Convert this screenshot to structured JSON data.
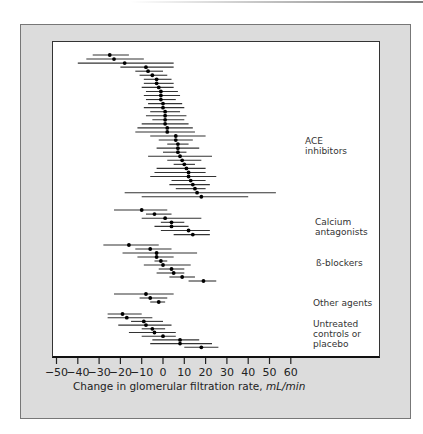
{
  "chart_data": {
    "type": "forest",
    "title": "",
    "xlabel": "Change in glomerular filtration rate,",
    "xlabel_unit": "mL/min",
    "ylabel": "",
    "xlim": [
      -50,
      60
    ],
    "x_ticks": [
      -50,
      -40,
      -30,
      -20,
      -10,
      0,
      10,
      20,
      30,
      40,
      50,
      60
    ],
    "x_tick_labels": [
      "−50",
      "−40",
      "−30",
      "−20",
      "−10",
      "0",
      "10",
      "20",
      "30",
      "40",
      "50",
      "60"
    ],
    "grid": false,
    "groups": [
      {
        "name": "ACE inhibitors",
        "label_lines": [
          "ACE",
          "inhibitors"
        ],
        "studies": [
          {
            "mean": -25,
            "low": -33,
            "high": -16
          },
          {
            "mean": -23,
            "low": -36,
            "high": -9
          },
          {
            "mean": -18,
            "low": -40,
            "high": 5
          },
          {
            "mean": -8,
            "low": -20,
            "high": 5
          },
          {
            "mean": -7,
            "low": -13,
            "high": 0
          },
          {
            "mean": -5,
            "low": -11,
            "high": 2
          },
          {
            "mean": -3,
            "low": -9,
            "high": 4
          },
          {
            "mean": -3,
            "low": -9,
            "high": 5
          },
          {
            "mean": -2,
            "low": -10,
            "high": 5
          },
          {
            "mean": -1,
            "low": -8,
            "high": 7
          },
          {
            "mean": -1,
            "low": -9,
            "high": 8
          },
          {
            "mean": -1,
            "low": -8,
            "high": 6
          },
          {
            "mean": 0,
            "low": -7,
            "high": 9
          },
          {
            "mean": 0,
            "low": -9,
            "high": 10
          },
          {
            "mean": 1,
            "low": -6,
            "high": 8
          },
          {
            "mean": 1,
            "low": -8,
            "high": 11
          },
          {
            "mean": 1,
            "low": -5,
            "high": 10
          },
          {
            "mean": 1,
            "low": -10,
            "high": 12
          },
          {
            "mean": 2,
            "low": -12,
            "high": 14
          },
          {
            "mean": 2,
            "low": -13,
            "high": 15
          },
          {
            "mean": 6,
            "low": -6,
            "high": 20
          },
          {
            "mean": 6,
            "low": -2,
            "high": 14
          },
          {
            "mean": 7,
            "low": 2,
            "high": 12
          },
          {
            "mean": 7,
            "low": -3,
            "high": 17
          },
          {
            "mean": 7,
            "low": 0,
            "high": 11
          },
          {
            "mean": 8,
            "low": -7,
            "high": 23
          },
          {
            "mean": 9,
            "low": 2,
            "high": 18
          },
          {
            "mean": 10,
            "low": 5,
            "high": 15
          },
          {
            "mean": 11,
            "low": -3,
            "high": 20
          },
          {
            "mean": 12,
            "low": -4,
            "high": 20
          },
          {
            "mean": 12,
            "low": -6,
            "high": 25
          },
          {
            "mean": 13,
            "low": 4,
            "high": 20
          },
          {
            "mean": 14,
            "low": 3,
            "high": 22
          },
          {
            "mean": 15,
            "low": 6,
            "high": 20
          },
          {
            "mean": 16,
            "low": -18,
            "high": 53
          },
          {
            "mean": 18,
            "low": -10,
            "high": 40
          }
        ]
      },
      {
        "name": "Calcium antagonists",
        "label_lines": [
          "Calcium",
          "antagonists"
        ],
        "studies": [
          {
            "mean": -10,
            "low": -23,
            "high": 2
          },
          {
            "mean": -4,
            "low": -8,
            "high": 4
          },
          {
            "mean": 1,
            "low": -10,
            "high": 18
          },
          {
            "mean": 4,
            "low": -1,
            "high": 10
          },
          {
            "mean": 4,
            "low": -4,
            "high": 12
          },
          {
            "mean": 12,
            "low": -1,
            "high": 22
          },
          {
            "mean": 14,
            "low": 5,
            "high": 22
          }
        ]
      },
      {
        "name": "ß-blockers",
        "label_lines": [
          "ß-blockers"
        ],
        "studies": [
          {
            "mean": -16,
            "low": -28,
            "high": -2
          },
          {
            "mean": -6,
            "low": -13,
            "high": 4
          },
          {
            "mean": -3,
            "low": -19,
            "high": 16
          },
          {
            "mean": -3,
            "low": -12,
            "high": 5
          },
          {
            "mean": -1,
            "low": -4,
            "high": 2
          },
          {
            "mean": 0,
            "low": -9,
            "high": 13
          },
          {
            "mean": 4,
            "low": -2,
            "high": 10
          },
          {
            "mean": 5,
            "low": -3,
            "high": 10
          },
          {
            "mean": 9,
            "low": 3,
            "high": 15
          },
          {
            "mean": 19,
            "low": 12,
            "high": 25
          }
        ]
      },
      {
        "name": "Other agents",
        "label_lines": [
          "Other agents"
        ],
        "studies": [
          {
            "mean": -8,
            "low": -23,
            "high": 5
          },
          {
            "mean": -6,
            "low": -11,
            "high": 2
          },
          {
            "mean": -2,
            "low": -6,
            "high": 1
          }
        ]
      },
      {
        "name": "Untreated controls or placebo",
        "label_lines": [
          "Untreated",
          "controls or",
          "placebo"
        ],
        "studies": [
          {
            "mean": -19,
            "low": -26,
            "high": -10
          },
          {
            "mean": -17,
            "low": -26,
            "high": -5
          },
          {
            "mean": -9,
            "low": -15,
            "high": 0
          },
          {
            "mean": -8,
            "low": -21,
            "high": 4
          },
          {
            "mean": -5,
            "low": -10,
            "high": 1
          },
          {
            "mean": -4,
            "low": -16,
            "high": 6
          },
          {
            "mean": 0,
            "low": -10,
            "high": 6
          },
          {
            "mean": 8,
            "low": -5,
            "high": 17
          },
          {
            "mean": 8,
            "low": -6,
            "high": 23
          },
          {
            "mean": 18,
            "low": 10,
            "high": 26
          }
        ]
      }
    ]
  },
  "layout": {
    "group_label_tops": [
      136,
      213,
      255,
      296,
      318
    ],
    "group_row_starts": [
      55,
      210,
      245,
      294,
      314
    ],
    "group_row_spacing": [
      4.05,
      4.1,
      4.0,
      4.0,
      3.7
    ]
  }
}
